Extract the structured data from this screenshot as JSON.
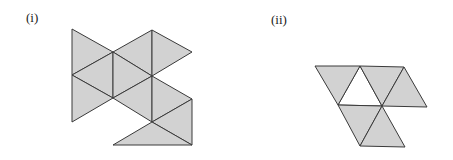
{
  "figures": [
    {
      "label": "(i)",
      "description": "Net of 9 equilateral triangles, shaded gray",
      "fill": "#d2d2d2",
      "triangles": [
        [
          [
            72,
            29
          ],
          [
            113,
            52
          ],
          [
            72,
            75
          ]
        ],
        [
          [
            72,
            75
          ],
          [
            113,
            52
          ],
          [
            113,
            98
          ]
        ],
        [
          [
            72,
            75
          ],
          [
            113,
            98
          ],
          [
            72,
            122
          ]
        ],
        [
          [
            113,
            52
          ],
          [
            152,
            30
          ],
          [
            152,
            76
          ]
        ],
        [
          [
            152,
            30
          ],
          [
            192,
            52
          ],
          [
            152,
            76
          ]
        ],
        [
          [
            113,
            52
          ],
          [
            152,
            76
          ],
          [
            113,
            98
          ]
        ],
        [
          [
            113,
            98
          ],
          [
            152,
            76
          ],
          [
            152,
            122
          ]
        ],
        [
          [
            152,
            76
          ],
          [
            192,
            99
          ],
          [
            152,
            122
          ]
        ],
        [
          [
            152,
            122
          ],
          [
            192,
            99
          ],
          [
            192,
            145
          ]
        ],
        [
          [
            113,
            145
          ],
          [
            152,
            122
          ],
          [
            192,
            145
          ]
        ]
      ]
    },
    {
      "label": "(ii)",
      "description": "Net of equilateral triangles with one unshaded triangle",
      "fill": "#d2d2d2",
      "triangles": [
        [
          [
            315,
            66
          ],
          [
            360,
            66
          ],
          [
            338,
            105
          ]
        ],
        [
          [
            360,
            66
          ],
          [
            404,
            67
          ],
          [
            382,
            106
          ]
        ],
        [
          [
            404,
            67
          ],
          [
            427,
            107
          ],
          [
            382,
            106
          ]
        ],
        [
          [
            338,
            105
          ],
          [
            382,
            106
          ],
          [
            360,
            146
          ]
        ],
        [
          [
            382,
            106
          ],
          [
            405,
            147
          ],
          [
            360,
            146
          ]
        ]
      ],
      "unshaded": [
        [
          [
            360,
            66
          ],
          [
            382,
            106
          ],
          [
            338,
            105
          ]
        ]
      ]
    }
  ]
}
